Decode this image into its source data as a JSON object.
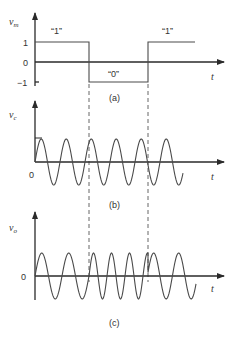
{
  "figure": {
    "dash_x": [
      89,
      148
    ],
    "panels": [
      {
        "id": "a",
        "caption": "(a)",
        "ylabel_main": "v",
        "ylabel_sub": "m",
        "xlabel": "t",
        "ticks": [
          "1",
          "0",
          "−1"
        ],
        "bits": [
          "“1”",
          "“0”",
          "“1”"
        ],
        "signal": "square",
        "levels": {
          "one": 42,
          "zero": 62,
          "minus_one": 82
        }
      },
      {
        "id": "b",
        "caption": "(b)",
        "ylabel_main": "v",
        "ylabel_sub": "c",
        "xlabel": "t",
        "origin_label": "0",
        "signal": "carrier sine"
      },
      {
        "id": "c",
        "caption": "(c)",
        "ylabel_main": "v",
        "ylabel_sub": "o",
        "xlabel": "t",
        "origin_label": "0",
        "signal": "phase-modulated sine"
      }
    ]
  }
}
